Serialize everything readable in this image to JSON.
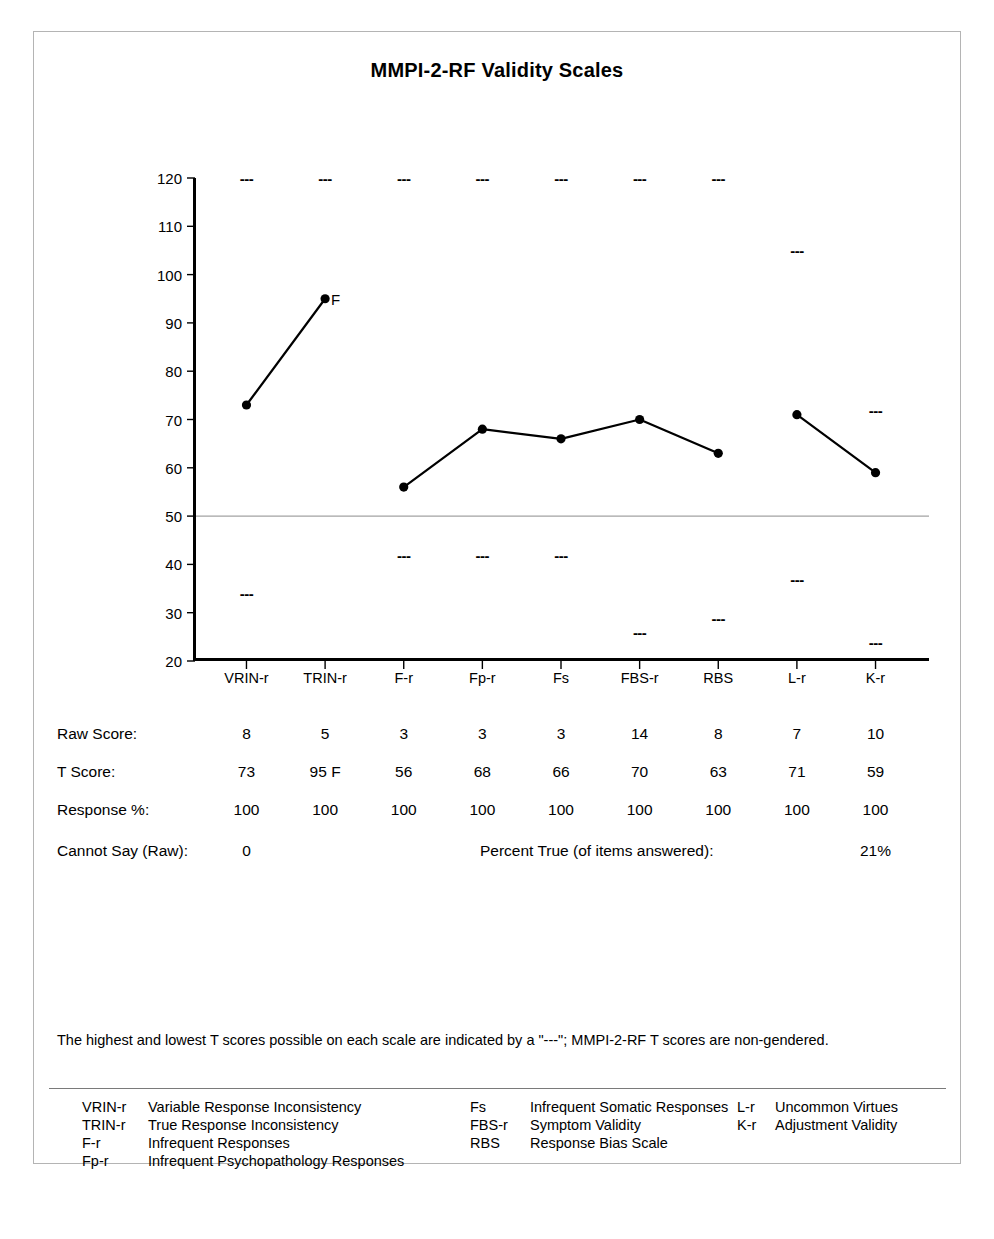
{
  "chart_data": {
    "type": "line",
    "title": "MMPI-2-RF Validity Scales",
    "xlabel": "",
    "ylabel": "",
    "ylim": [
      20,
      120
    ],
    "yticks": [
      120,
      110,
      100,
      90,
      80,
      70,
      60,
      50,
      40,
      30,
      20
    ],
    "grid": false,
    "reference_line": 50,
    "legend_position": "none",
    "categories": [
      "VRIN-r",
      "TRIN-r",
      "F-r",
      "Fp-r",
      "Fs",
      "FBS-r",
      "RBS",
      "L-r",
      "K-r"
    ],
    "series": [
      {
        "name": "T Score",
        "values": [
          73,
          95,
          56,
          68,
          66,
          70,
          63,
          71,
          59
        ],
        "segments": [
          [
            0,
            1
          ],
          [
            2,
            3,
            4,
            5,
            6
          ],
          [
            7,
            8
          ]
        ]
      }
    ],
    "point_annotations": [
      {
        "category": "TRIN-r",
        "value": 95,
        "text": "F"
      }
    ],
    "max_markers": {
      "label": "---",
      "values": [
        120,
        120,
        120,
        120,
        120,
        120,
        120,
        105,
        72
      ]
    },
    "min_markers": {
      "label": "---",
      "values": [
        34,
        null,
        42,
        42,
        42,
        26,
        29,
        37,
        24
      ]
    }
  },
  "report": {
    "title": "MMPI-2-RF Validity Scales",
    "scales": [
      "VRIN-r",
      "TRIN-r",
      "F-r",
      "Fp-r",
      "Fs",
      "FBS-r",
      "RBS",
      "L-r",
      "K-r"
    ],
    "rows": [
      {
        "label": "Raw Score:",
        "values": [
          "8",
          "5",
          "3",
          "3",
          "3",
          "14",
          "8",
          "7",
          "10"
        ]
      },
      {
        "label": "T Score:",
        "values": [
          "73",
          "95 F",
          "56",
          "68",
          "66",
          "70",
          "63",
          "71",
          "59"
        ]
      },
      {
        "label": "Response %:",
        "values": [
          "100",
          "100",
          "100",
          "100",
          "100",
          "100",
          "100",
          "100",
          "100"
        ]
      }
    ],
    "cannot_say": {
      "label": "Cannot Say (Raw):",
      "value": "0"
    },
    "percent_true": {
      "label": "Percent True (of items answered):",
      "value": "21%"
    },
    "footnote": "The highest and lowest T scores possible on each scale are indicated by a \"---\"; MMPI-2-RF T scores are non-gendered.",
    "legend": {
      "column_1": [
        {
          "abbr": "VRIN-r",
          "name": "Variable Response Inconsistency"
        },
        {
          "abbr": "TRIN-r",
          "name": "True Response Inconsistency"
        },
        {
          "abbr": "F-r",
          "name": "Infrequent Responses"
        },
        {
          "abbr": "Fp-r",
          "name": "Infrequent Psychopathology Responses"
        }
      ],
      "column_2": [
        {
          "abbr": "Fs",
          "name": "Infrequent Somatic Responses"
        },
        {
          "abbr": "FBS-r",
          "name": "Symptom Validity"
        },
        {
          "abbr": "RBS",
          "name": "Response Bias Scale"
        }
      ],
      "column_3": [
        {
          "abbr": "L-r",
          "name": "Uncommon Virtues"
        },
        {
          "abbr": "K-r",
          "name": "Adjustment Validity"
        }
      ]
    },
    "colors": {
      "line": "#000000",
      "marker": "#000000",
      "axis": "#000000",
      "reference_line": "#8c8c8c",
      "border": "#b4b4b4"
    }
  }
}
